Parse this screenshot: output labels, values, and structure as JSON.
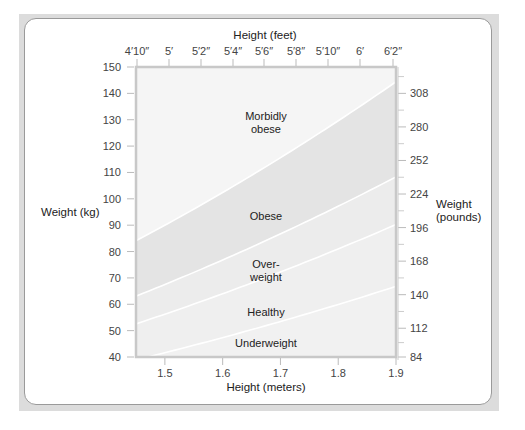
{
  "chart_data": {
    "type": "area",
    "title": "",
    "top_axis": {
      "label": "Height (feet)",
      "ticks": [
        "4′10″",
        "5′",
        "5′2″",
        "5′4″",
        "5′6″",
        "5′8″",
        "5′10″",
        "6′",
        "6′2″"
      ],
      "tick_x_px": [
        137,
        169,
        201,
        233,
        264,
        296,
        328,
        360,
        393
      ]
    },
    "bottom_axis": {
      "label": "Height (meters)",
      "ticks": [
        1.5,
        1.6,
        1.7,
        1.8,
        1.9
      ],
      "range": [
        1.45,
        1.9
      ]
    },
    "left_axis": {
      "label": "Weight (kg)",
      "ticks": [
        40,
        50,
        60,
        70,
        80,
        90,
        100,
        110,
        120,
        130,
        140,
        150
      ],
      "range": [
        40,
        150
      ]
    },
    "right_axis": {
      "label_line1": "Weight",
      "label_line2": "(pounds)",
      "ticks": [
        84,
        112,
        140,
        168,
        196,
        224,
        252,
        280,
        308
      ]
    },
    "boundaries_bmi": [
      18.5,
      25,
      30,
      40
    ],
    "bands": [
      {
        "name": "Underweight",
        "label": "Underweight",
        "bmi_min": 0,
        "bmi_max": 18.5,
        "color": "#f1f1f1",
        "label_x": 1.675,
        "label_y": 45.5
      },
      {
        "name": "Healthy",
        "label": "Healthy",
        "bmi_min": 18.5,
        "bmi_max": 25,
        "color": "#efefef",
        "label_x": 1.675,
        "label_y": 57
      },
      {
        "name": "Overweight",
        "label_line1": "Over-",
        "label_line2": "weight",
        "bmi_min": 25,
        "bmi_max": 30,
        "color": "#ececec",
        "label_x": 1.675,
        "label_y": 73
      },
      {
        "name": "Obese",
        "label": "Obese",
        "bmi_min": 30,
        "bmi_max": 40,
        "color": "#e4e4e4",
        "label_x": 1.675,
        "label_y": 93.5
      },
      {
        "name": "Morbidly obese",
        "label_line1": "Morbidly",
        "label_line2": "obese",
        "bmi_min": 40,
        "bmi_max": 999,
        "color": "#f5f5f5",
        "label_x": 1.675,
        "label_y": 129
      }
    ],
    "grid": false,
    "legend": "none (labels inside bands)"
  }
}
